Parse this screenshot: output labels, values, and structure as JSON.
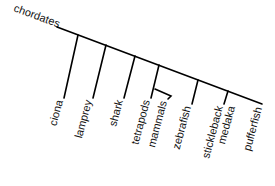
{
  "diagram": {
    "type": "cladogram",
    "root_label": "chordates",
    "line_color": "#000000",
    "text_color": "#111111",
    "taxa": [
      {
        "id": "ciona",
        "label": "ciona"
      },
      {
        "id": "lamprey",
        "label": "lamprey"
      },
      {
        "id": "shark",
        "label": "shark"
      },
      {
        "id": "tetrapods",
        "label": "tetrapods"
      },
      {
        "id": "mammals",
        "label": "mammals"
      },
      {
        "id": "zebrafish",
        "label": "zebrafish"
      },
      {
        "id": "stickleback",
        "label": "stickleback"
      },
      {
        "id": "medaka",
        "label": "medaka"
      },
      {
        "id": "pufferfish",
        "label": "pufferfish"
      }
    ]
  }
}
